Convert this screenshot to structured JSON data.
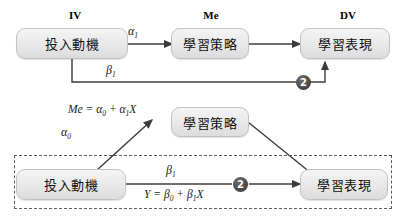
{
  "figure": {
    "colors": {
      "node_fill_top": "#f4f4f4",
      "node_fill_bottom": "#dcdcdc",
      "node_border": "#c3c3c3",
      "line": "#444444",
      "marker_fill": "#4a4a4a",
      "marker_text": "#ffffff",
      "dash_border": "#5a5a5a",
      "text": "#111111"
    }
  },
  "top_panel": {
    "headers": [
      {
        "id": "iv",
        "label": "IV"
      },
      {
        "id": "me",
        "label": "Me"
      },
      {
        "id": "dv",
        "label": "DV"
      }
    ],
    "nodes": [
      {
        "id": "iv",
        "label": "投入動機"
      },
      {
        "id": "me",
        "label": "學習策略"
      },
      {
        "id": "dv",
        "label": "學習表現"
      }
    ],
    "path_labels": [
      {
        "id": "alpha1",
        "base": "α",
        "sub": "1"
      },
      {
        "id": "beta1",
        "base": "β",
        "sub": "1"
      }
    ],
    "marker": {
      "id": "marker-2-top",
      "label": "2"
    }
  },
  "bottom_panel": {
    "nodes": [
      {
        "id": "iv",
        "label": "投入動機"
      },
      {
        "id": "me",
        "label": "學習策略"
      },
      {
        "id": "dv",
        "label": "學習表現"
      }
    ],
    "equations": [
      {
        "id": "me-equation",
        "lhs": "Me",
        "rel": " = ",
        "t1_base": "α",
        "t1_sub": "0",
        "plus": " + ",
        "t2_base": "α",
        "t2_sub": "1",
        "t2_var": "X"
      },
      {
        "id": "y-equation",
        "lhs": "Y",
        "rel": " = ",
        "t1_base": "β",
        "t1_sub": "0",
        "plus": " + ",
        "t2_base": "β",
        "t2_sub": "1",
        "t2_var": "X"
      }
    ],
    "path_labels": [
      {
        "id": "alpha0",
        "base": "α",
        "sub": "0"
      },
      {
        "id": "beta1",
        "base": "β",
        "sub": "1"
      }
    ],
    "marker": {
      "id": "marker-2-bottom",
      "label": "2"
    }
  }
}
